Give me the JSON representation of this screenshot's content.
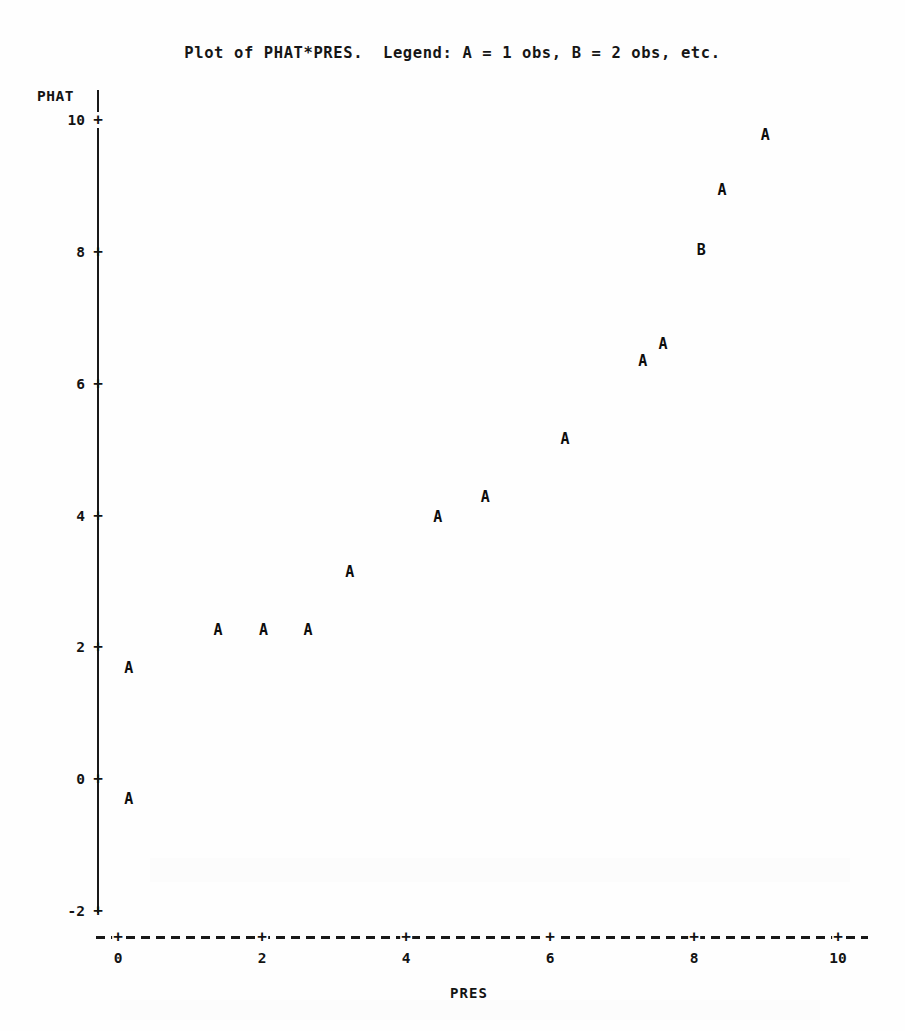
{
  "title": "Plot of PHAT*PRES.  Legend: A = 1 obs, B = 2 obs, etc.",
  "chart_data": {
    "type": "scatter",
    "title": "Plot of PHAT*PRES.  Legend: A = 1 obs, B = 2 obs, etc.",
    "xlabel": "PRES",
    "ylabel": "PHAT",
    "xlim": [
      -0.4,
      10.5
    ],
    "ylim": [
      -2.3,
      10.3
    ],
    "xticks": [
      0,
      2,
      4,
      6,
      8,
      10
    ],
    "yticks": [
      10,
      8,
      6,
      4,
      2,
      0,
      -2
    ],
    "xtick_labels": [
      "0",
      "2",
      "4",
      "6",
      "8",
      "10"
    ],
    "ytick_labels": [
      "10",
      "8",
      "6",
      "4",
      "2",
      "0",
      "-2"
    ],
    "grid": false,
    "legend": "A = 1 obs, B = 2 obs, etc.",
    "legend_position": "in-title",
    "tick_mark_glyph": "+",
    "x_axis_style": "dashed",
    "y_axis_style": "solid",
    "points": [
      {
        "x": 0.15,
        "y": -0.3,
        "symbol": "A",
        "count": 1
      },
      {
        "x": 0.15,
        "y": 1.68,
        "symbol": "A",
        "count": 1
      },
      {
        "x": 1.39,
        "y": 2.26,
        "symbol": "A",
        "count": 1
      },
      {
        "x": 2.02,
        "y": 2.26,
        "symbol": "A",
        "count": 1
      },
      {
        "x": 2.64,
        "y": 2.26,
        "symbol": "A",
        "count": 1
      },
      {
        "x": 3.22,
        "y": 3.14,
        "symbol": "A",
        "count": 1
      },
      {
        "x": 4.44,
        "y": 3.98,
        "symbol": "A",
        "count": 1
      },
      {
        "x": 5.1,
        "y": 4.28,
        "symbol": "A",
        "count": 1
      },
      {
        "x": 6.21,
        "y": 5.16,
        "symbol": "A",
        "count": 1
      },
      {
        "x": 7.29,
        "y": 6.34,
        "symbol": "A",
        "count": 1
      },
      {
        "x": 7.57,
        "y": 6.6,
        "symbol": "A",
        "count": 1
      },
      {
        "x": 8.1,
        "y": 8.03,
        "symbol": "B",
        "count": 2
      },
      {
        "x": 8.39,
        "y": 8.94,
        "symbol": "A",
        "count": 1
      },
      {
        "x": 8.99,
        "y": 9.78,
        "symbol": "A",
        "count": 1
      }
    ]
  },
  "colors": {
    "ink": "#111111",
    "page": "#fefefe"
  }
}
